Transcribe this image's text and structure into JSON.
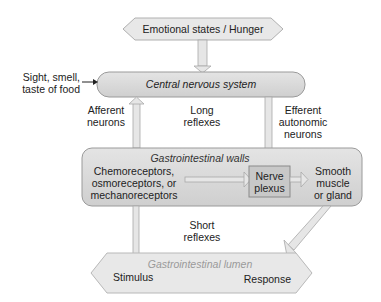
{
  "diagram": {
    "nodes": {
      "emotional": "Emotional states / Hunger",
      "cns": "Central nervous system",
      "sensory_input_line1": "Sight, smell,",
      "sensory_input_line2": "taste of food",
      "gi_walls": "Gastrointestinal walls",
      "receptors_line1": "Chemoreceptors,",
      "receptors_line2": "osmoreceptors, or",
      "receptors_line3": "mechanoreceptors",
      "plexus_line1": "Nerve",
      "plexus_line2": "plexus",
      "effector_line1": "Smooth",
      "effector_line2": "muscle",
      "effector_line3": "or gland",
      "lumen": "Gastrointestinal lumen",
      "stimulus": "Stimulus",
      "response": "Response"
    },
    "labels": {
      "afferent_line1": "Afferent",
      "afferent_line2": "neurons",
      "long_line1": "Long",
      "long_line2": "reflexes",
      "efferent_line1": "Efferent",
      "efferent_line2": "autonomic",
      "efferent_line3": "neurons",
      "short_line1": "Short",
      "short_line2": "reflexes"
    },
    "colors": {
      "box_fill": "#d6d6d6",
      "box_stroke": "#9a9a9a",
      "plexus_fill": "#c4c4c4",
      "arrow_fill": "#dcdcdc",
      "lumen_text": "#9a9a9a"
    }
  }
}
